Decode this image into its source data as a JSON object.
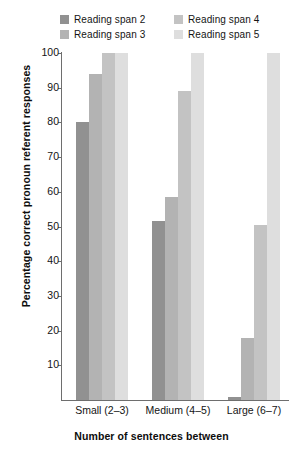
{
  "legend": {
    "entries": [
      {
        "label": "Reading span 2",
        "color": "#919191"
      },
      {
        "label": "Reading span 3",
        "color": "#b3b3b3"
      },
      {
        "label": "Reading span 4",
        "color": "#c3c3c3"
      },
      {
        "label": "Reading span 5",
        "color": "#dedede"
      }
    ]
  },
  "chart_data": {
    "type": "bar",
    "title": "",
    "xlabel": "Number of sentences between",
    "ylabel": "Percentage correct pronoun referent responses",
    "categories": [
      "Small (2–3)",
      "Medium (4–5)",
      "Large (6–7)"
    ],
    "series": [
      {
        "name": "Reading span 2",
        "color": "#919191",
        "values": [
          80,
          51.5,
          1
        ]
      },
      {
        "name": "Reading span 3",
        "color": "#b3b3b3",
        "values": [
          94,
          58.5,
          18
        ]
      },
      {
        "name": "Reading span 4",
        "color": "#c3c3c3",
        "values": [
          100,
          89,
          50.5
        ]
      },
      {
        "name": "Reading span 5",
        "color": "#dedede",
        "values": [
          100,
          100,
          100
        ]
      }
    ],
    "ylim": [
      0,
      100
    ],
    "yticks": [
      10,
      20,
      30,
      40,
      50,
      60,
      70,
      80,
      90,
      100
    ],
    "ytick_labels": [
      "10",
      "20",
      "30",
      "40",
      "50",
      "60",
      "70",
      "80",
      "90",
      "100"
    ],
    "grid": false,
    "legend_position": "top"
  }
}
